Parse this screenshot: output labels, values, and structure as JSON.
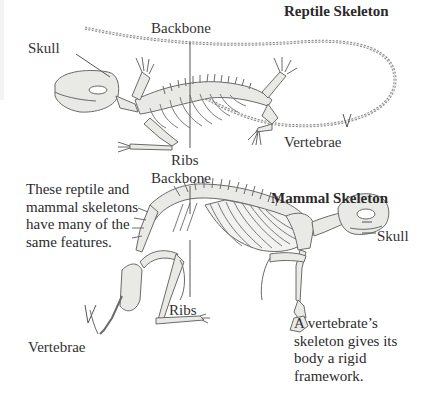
{
  "reptile": {
    "title": "Reptile Skeleton",
    "labels": {
      "skull": "Skull",
      "backbone": "Backbone",
      "ribs": "Ribs",
      "vertebrae": "Vertebrae"
    }
  },
  "mammal": {
    "title": "Mammal Skeleton",
    "labels": {
      "skull": "Skull",
      "backbone": "Backbone",
      "ribs": "Ribs",
      "vertebrae": "Vertebrae"
    }
  },
  "captions": {
    "comparison": [
      "These reptile and",
      "mammal skeletons",
      "have many of the",
      "same features."
    ],
    "framework": [
      "A vertebrate’s",
      "skeleton gives its",
      "body a rigid",
      "framework."
    ]
  },
  "colors": {
    "bone_fill": "#e9e9e6",
    "bone_stroke": "#6a6a6a",
    "leader_line": "#555555",
    "text": "#2b2b2b"
  }
}
